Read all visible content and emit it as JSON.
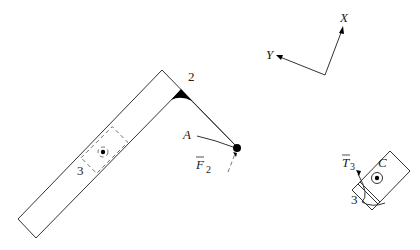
{
  "diagram": {
    "labels": {
      "link_number": "2",
      "slider_number": "3",
      "point_a": "A",
      "force": "F",
      "force_sub": "2",
      "torque": "T",
      "torque_sub": "3",
      "body_c": "C",
      "body_c_number": "3",
      "axis_x": "X",
      "axis_y": "Y"
    },
    "colors": {
      "stroke": "#333333",
      "fill_point": "#000000",
      "background": "#ffffff"
    }
  }
}
